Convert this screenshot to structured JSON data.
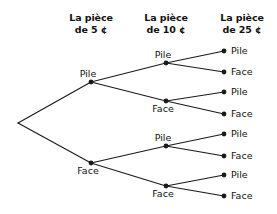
{
  "figure": {
    "type": "probability-tree-diagram",
    "background_color": "#ffffff",
    "line_color": "#1a1a1a",
    "text_color": "#111111"
  },
  "headers": [
    {
      "id": "header-5c",
      "line1": "La pièce",
      "line2": "de 5 ¢",
      "x": 91,
      "y": 12
    },
    {
      "id": "header-10c",
      "line1": "La pièce",
      "line2": "de 10 ¢",
      "x": 166,
      "y": 12
    },
    {
      "id": "header-25c",
      "line1": "La pièce",
      "line2": "de 25 ¢",
      "x": 242,
      "y": 12
    }
  ],
  "nodes": {
    "root": {
      "id": "root",
      "x": 18,
      "y": 123,
      "label": "",
      "dot": false
    },
    "level1": [
      {
        "id": "n-p",
        "label": "Pile",
        "x": 91,
        "y": 82,
        "dot": true,
        "label_pos": "center-above",
        "lx": 88,
        "ly": 79
      },
      {
        "id": "n-f",
        "label": "Face",
        "x": 91,
        "y": 163,
        "dot": true,
        "label_pos": "center-below",
        "lx": 88,
        "ly": 166
      }
    ],
    "level2": [
      {
        "id": "n-pp",
        "label": "Pile",
        "x": 166,
        "y": 63,
        "dot": true,
        "label_pos": "center-above",
        "lx": 163,
        "ly": 60
      },
      {
        "id": "n-pf",
        "label": "Face",
        "x": 166,
        "y": 101,
        "dot": true,
        "label_pos": "center-below",
        "lx": 163,
        "ly": 104
      },
      {
        "id": "n-fp",
        "label": "Pile",
        "x": 166,
        "y": 146,
        "dot": true,
        "label_pos": "center-above",
        "lx": 163,
        "ly": 143
      },
      {
        "id": "n-ff",
        "label": "Face",
        "x": 166,
        "y": 186,
        "dot": true,
        "label_pos": "center-below",
        "lx": 163,
        "ly": 189
      }
    ],
    "level3": [
      {
        "id": "leaf-ppp",
        "label": "Pile",
        "x": 224,
        "y": 51,
        "dot": true,
        "label_pos": "right-of",
        "lx": 231,
        "ly": 51
      },
      {
        "id": "leaf-ppf",
        "label": "Face",
        "x": 224,
        "y": 72,
        "dot": true,
        "label_pos": "right-of",
        "lx": 231,
        "ly": 72
      },
      {
        "id": "leaf-pfp",
        "label": "Pile",
        "x": 224,
        "y": 92,
        "dot": true,
        "label_pos": "right-of",
        "lx": 231,
        "ly": 92
      },
      {
        "id": "leaf-pff",
        "label": "Face",
        "x": 224,
        "y": 114,
        "dot": true,
        "label_pos": "right-of",
        "lx": 231,
        "ly": 114
      },
      {
        "id": "leaf-fpp",
        "label": "Pile",
        "x": 224,
        "y": 134,
        "dot": true,
        "label_pos": "right-of",
        "lx": 231,
        "ly": 134
      },
      {
        "id": "leaf-fpf",
        "label": "Face",
        "x": 224,
        "y": 156,
        "dot": true,
        "label_pos": "right-of",
        "lx": 231,
        "ly": 156
      },
      {
        "id": "leaf-ffp",
        "label": "Pile",
        "x": 224,
        "y": 175,
        "dot": true,
        "label_pos": "right-of",
        "lx": 231,
        "ly": 175
      },
      {
        "id": "leaf-fff",
        "label": "Face",
        "x": 224,
        "y": 196,
        "dot": true,
        "label_pos": "right-of",
        "lx": 231,
        "ly": 196
      }
    ]
  },
  "edges": [
    {
      "id": "edge-root-p",
      "x1": 18,
      "y1": 123,
      "x2": 91,
      "y2": 82
    },
    {
      "id": "edge-root-f",
      "x1": 18,
      "y1": 123,
      "x2": 91,
      "y2": 163
    },
    {
      "id": "edge-p-pp",
      "x1": 91,
      "y1": 82,
      "x2": 166,
      "y2": 63
    },
    {
      "id": "edge-p-pf",
      "x1": 91,
      "y1": 82,
      "x2": 166,
      "y2": 101
    },
    {
      "id": "edge-f-fp",
      "x1": 91,
      "y1": 163,
      "x2": 166,
      "y2": 146
    },
    {
      "id": "edge-f-ff",
      "x1": 91,
      "y1": 163,
      "x2": 166,
      "y2": 186
    },
    {
      "id": "edge-pp-ppp",
      "x1": 166,
      "y1": 63,
      "x2": 224,
      "y2": 51
    },
    {
      "id": "edge-pp-ppf",
      "x1": 166,
      "y1": 63,
      "x2": 224,
      "y2": 72
    },
    {
      "id": "edge-pf-pfp",
      "x1": 166,
      "y1": 101,
      "x2": 224,
      "y2": 92
    },
    {
      "id": "edge-pf-pff",
      "x1": 166,
      "y1": 101,
      "x2": 224,
      "y2": 114
    },
    {
      "id": "edge-fp-fpp",
      "x1": 166,
      "y1": 146,
      "x2": 224,
      "y2": 134
    },
    {
      "id": "edge-fp-fpf",
      "x1": 166,
      "y1": 146,
      "x2": 224,
      "y2": 156
    },
    {
      "id": "edge-ff-ffp",
      "x1": 166,
      "y1": 186,
      "x2": 224,
      "y2": 175
    },
    {
      "id": "edge-ff-fff",
      "x1": 166,
      "y1": 186,
      "x2": 224,
      "y2": 196
    }
  ]
}
